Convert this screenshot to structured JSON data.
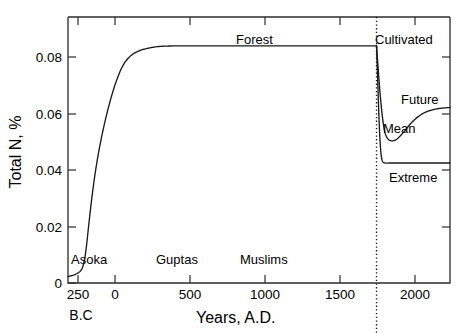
{
  "chart_data": {
    "type": "line",
    "title": "",
    "xlabel": "Years, A.D.",
    "ylabel": "Total N, %",
    "xlim": [
      -400,
      2200
    ],
    "ylim": [
      0,
      0.092
    ],
    "grid": false,
    "legend": "none",
    "xticks": [
      {
        "value": -250,
        "label": "250"
      },
      {
        "value": 0,
        "label": "0"
      },
      {
        "value": 500,
        "label": "500"
      },
      {
        "value": 1000,
        "label": "1000"
      },
      {
        "value": 1500,
        "label": "1500"
      },
      {
        "value": 2000,
        "label": "2000"
      }
    ],
    "xtick_suffix_label": "B.C",
    "yticks": [
      {
        "value": 0,
        "label": "0"
      },
      {
        "value": 0.02,
        "label": "0.02"
      },
      {
        "value": 0.04,
        "label": "0.04"
      },
      {
        "value": 0.06,
        "label": "0.06"
      },
      {
        "value": 0.08,
        "label": "0.08"
      }
    ],
    "divider": {
      "value": 1700,
      "style": "dotted",
      "label": ""
    },
    "annotations": [
      {
        "text": "Forest",
        "x": 1020,
        "y": 0.0865
      },
      {
        "text": "Cultivated",
        "x": 1950,
        "y": 0.0865
      },
      {
        "text": "Future",
        "x": 2080,
        "y": 0.0645
      },
      {
        "text": "Mean",
        "x": 1820,
        "y": 0.0555
      },
      {
        "text": "Extreme",
        "x": 1960,
        "y": 0.0365
      },
      {
        "text": "Asoka",
        "x": -150,
        "y": 0.0105
      },
      {
        "text": "Guptas",
        "x": 410,
        "y": 0.0105
      },
      {
        "text": "Muslims",
        "x": 970,
        "y": 0.0105
      }
    ],
    "series": [
      {
        "name": "Forest",
        "points": [
          [
            -400,
            0.0022
          ],
          [
            -350,
            0.003
          ],
          [
            -310,
            0.0045
          ],
          [
            -290,
            0.0075
          ],
          [
            -275,
            0.0125
          ],
          [
            -260,
            0.0195
          ],
          [
            -240,
            0.0285
          ],
          [
            -215,
            0.038
          ],
          [
            -185,
            0.047
          ],
          [
            -150,
            0.0555
          ],
          [
            -110,
            0.0635
          ],
          [
            -70,
            0.07
          ],
          [
            -25,
            0.0753
          ],
          [
            25,
            0.0785
          ],
          [
            80,
            0.0802
          ],
          [
            145,
            0.0812
          ],
          [
            220,
            0.0818
          ],
          [
            320,
            0.082
          ],
          [
            450,
            0.082
          ],
          [
            700,
            0.082
          ],
          [
            1000,
            0.082
          ],
          [
            1400,
            0.082
          ],
          [
            1700,
            0.082
          ]
        ]
      },
      {
        "name": "Mean",
        "points": [
          [
            1700,
            0.082
          ],
          [
            1712,
            0.0735
          ],
          [
            1725,
            0.065
          ],
          [
            1740,
            0.0575
          ],
          [
            1755,
            0.0525
          ],
          [
            1775,
            0.05
          ],
          [
            1800,
            0.0492
          ],
          [
            1830,
            0.0495
          ],
          [
            1860,
            0.0508
          ],
          [
            1895,
            0.0528
          ],
          [
            1930,
            0.055
          ],
          [
            1975,
            0.0572
          ],
          [
            2030,
            0.059
          ],
          [
            2090,
            0.06
          ],
          [
            2150,
            0.0605
          ],
          [
            2200,
            0.0607
          ]
        ]
      },
      {
        "name": "Extreme",
        "points": [
          [
            1700,
            0.082
          ],
          [
            1708,
            0.07
          ],
          [
            1716,
            0.058
          ],
          [
            1724,
            0.049
          ],
          [
            1732,
            0.044
          ],
          [
            1742,
            0.042
          ],
          [
            1760,
            0.0415
          ],
          [
            1800,
            0.0415
          ],
          [
            1900,
            0.0415
          ],
          [
            2050,
            0.0415
          ],
          [
            2200,
            0.0415
          ]
        ]
      }
    ]
  },
  "axes": {
    "x_title": "Years, A.D.",
    "y_title": "Total N, %",
    "bc_label": "B.C"
  }
}
